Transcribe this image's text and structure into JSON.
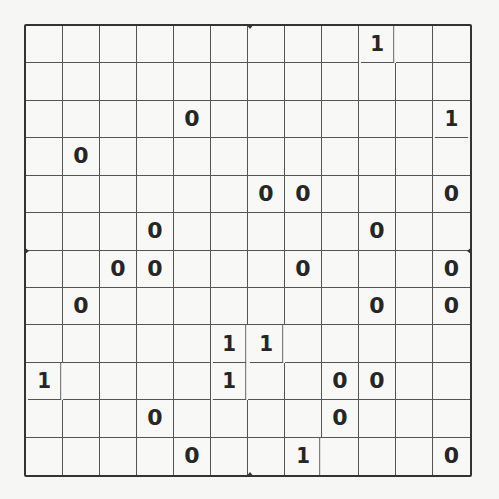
{
  "puzzle": {
    "type": "binary-grid",
    "rows": 12,
    "cols": 12,
    "colors": {
      "background": "#f6f6f4",
      "grid_line": "#555555",
      "border": "#333333",
      "digit": "#262626"
    },
    "grid": [
      [
        "",
        "",
        "",
        "",
        "",
        "",
        "",
        "",
        "",
        "1",
        "",
        ""
      ],
      [
        "",
        "",
        "",
        "",
        "",
        "",
        "",
        "",
        "",
        "",
        "",
        ""
      ],
      [
        "",
        "",
        "",
        "",
        "0",
        "",
        "",
        "",
        "",
        "",
        "",
        "1"
      ],
      [
        "",
        "0",
        "",
        "",
        "",
        "",
        "",
        "",
        "",
        "",
        "",
        ""
      ],
      [
        "",
        "",
        "",
        "",
        "",
        "",
        "0",
        "0",
        "",
        "",
        "",
        "0"
      ],
      [
        "",
        "",
        "",
        "0",
        "",
        "",
        "",
        "",
        "",
        "0",
        "",
        ""
      ],
      [
        "",
        "",
        "0",
        "0",
        "",
        "",
        "",
        "0",
        "",
        "",
        "",
        "0"
      ],
      [
        "",
        "0",
        "",
        "",
        "",
        "",
        "",
        "",
        "",
        "0",
        "",
        "0"
      ],
      [
        "",
        "",
        "",
        "",
        "",
        "1",
        "1",
        "",
        "",
        "",
        "",
        ""
      ],
      [
        "1",
        "",
        "",
        "",
        "",
        "1",
        "",
        "",
        "0",
        "0",
        "",
        ""
      ],
      [
        "",
        "",
        "",
        "0",
        "",
        "",
        "",
        "",
        "0",
        "",
        "",
        ""
      ],
      [
        "",
        "",
        "",
        "",
        "0",
        "",
        "",
        "1",
        "",
        "",
        "",
        "0"
      ]
    ]
  }
}
